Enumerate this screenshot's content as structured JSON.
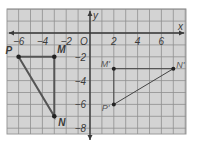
{
  "diagram": {
    "type": "coordinate-plane-translation",
    "colors": {
      "background": "#d3d3d3",
      "grid_line": "#8a8a8a",
      "axis": "#3a3a3a",
      "original_figure": "#555555",
      "image_figure": "#444444",
      "point": "#222222"
    },
    "axes": {
      "x_label": "x",
      "y_label": "y",
      "origin_label": "O",
      "x_ticks": [
        {
          "value": -6,
          "label": "−6"
        },
        {
          "value": -4,
          "label": "−4"
        },
        {
          "value": -2,
          "label": "−2"
        },
        {
          "value": 2,
          "label": "2"
        },
        {
          "value": 4,
          "label": "4"
        },
        {
          "value": 6,
          "label": "6"
        }
      ],
      "y_ticks": [
        {
          "value": -2,
          "label": "−2"
        },
        {
          "value": -4,
          "label": "−4"
        },
        {
          "value": -6,
          "label": "−6"
        },
        {
          "value": -8,
          "label": "−8"
        }
      ],
      "x_range": [
        -7,
        8
      ],
      "y_range": [
        -8.5,
        2
      ]
    },
    "figures": [
      {
        "name": "triangle PMN",
        "points": [
          {
            "label": "P",
            "x": -6,
            "y": -2
          },
          {
            "label": "M",
            "x": -3,
            "y": -2
          },
          {
            "label": "N",
            "x": -3,
            "y": -7
          }
        ]
      },
      {
        "name": "triangle P'M'N'",
        "points": [
          {
            "label": "P'",
            "x": 2,
            "y": -6
          },
          {
            "label": "M'",
            "x": 2,
            "y": -3
          },
          {
            "label": "N'",
            "x": 7,
            "y": -3
          }
        ]
      }
    ]
  }
}
